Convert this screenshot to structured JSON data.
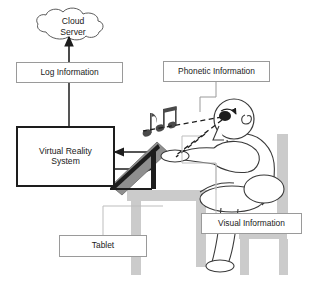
{
  "figure": {
    "kind": "system-architecture-diagram",
    "background_color": "#ffffff",
    "stroke_color": "#1d1d1d",
    "thin_stroke_color": "#9a9a9a",
    "fill_gray": "#c9c9c9",
    "width": 319,
    "height": 284
  },
  "nodes": {
    "cloud_server": {
      "label": "Cloud\nServer",
      "line1": "Cloud",
      "line2": "Server",
      "shape": "cloud"
    },
    "log_information": {
      "label": "Log Information",
      "shape": "rectangle",
      "border": "thin"
    },
    "virtual_reality_system": {
      "label": "Virtual Reality\nSystem",
      "line1": "Virtual Reality",
      "line2": "System",
      "shape": "rectangle",
      "border": "thick"
    },
    "phonetic_information": {
      "label": "Phonetic Information",
      "shape": "rectangle",
      "border": "thin"
    },
    "visual_information": {
      "label": "Visual Information",
      "shape": "rectangle",
      "border": "thin"
    },
    "tablet": {
      "label": "Tablet",
      "shape": "rectangle",
      "border": "thin"
    }
  },
  "scene_objects": {
    "person": "seated-person-figure",
    "desk": "desk",
    "chair": "chair",
    "tablet_device": "tablet-on-stand",
    "music_notes": "music-notes",
    "eye": "eye",
    "ear": "ear"
  },
  "connectors": [
    {
      "name": "log-to-cloud",
      "from": "log_information",
      "to": "cloud_server",
      "style": "solid",
      "arrow": "single"
    },
    {
      "name": "vr-to-log",
      "from": "virtual_reality_system",
      "to": "log_information",
      "style": "solid",
      "arrow": "none"
    },
    {
      "name": "scene-to-vr",
      "from": "scene",
      "to": "virtual_reality_system",
      "style": "solid",
      "arrow": "single-left"
    },
    {
      "name": "vr-to-scene",
      "from": "virtual_reality_system",
      "to": "scene",
      "style": "solid",
      "arrow": "single-right"
    },
    {
      "name": "phonetic-leader",
      "from": "phonetic_information",
      "to": "ear",
      "style": "solid",
      "arrow": "none"
    },
    {
      "name": "visual-leader",
      "from": "visual_information",
      "to": "tablet_device",
      "style": "solid",
      "arrow": "none"
    },
    {
      "name": "tablet-leader",
      "from": "tablet",
      "to": "tablet_device",
      "style": "solid",
      "arrow": "none"
    },
    {
      "name": "eye-to-notes",
      "from": "eye",
      "to": "music_notes",
      "style": "dashed",
      "arrow": "none"
    },
    {
      "name": "eye-to-tablet",
      "from": "eye",
      "to": "tablet_device",
      "style": "dashed",
      "arrow": "none"
    }
  ]
}
